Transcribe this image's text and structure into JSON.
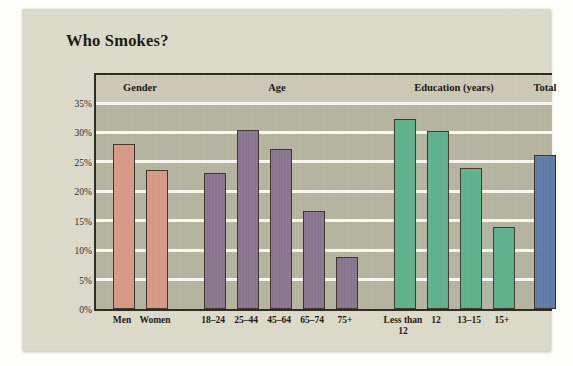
{
  "title": "Who Smokes?",
  "chart_data": {
    "type": "bar",
    "title": "Who Smokes?",
    "xlabel": "",
    "ylabel": "",
    "ylim": [
      0,
      35
    ],
    "ytick_labels": [
      "0%",
      "5%",
      "10%",
      "15%",
      "20%",
      "25%",
      "30%",
      "35%"
    ],
    "ytick_values": [
      0,
      5,
      10,
      15,
      20,
      25,
      30,
      35
    ],
    "grid": true,
    "legend": "none",
    "groups": [
      {
        "name": "Gender",
        "color": "#d79a84",
        "categories": [
          "Men",
          "Women"
        ],
        "values": [
          28.0,
          23.7
        ]
      },
      {
        "name": "Age",
        "color": "#8a7590",
        "categories": [
          "18–24",
          "25–44",
          "45–64",
          "65–74",
          "75+"
        ],
        "values": [
          23.1,
          30.5,
          27.2,
          16.7,
          8.8
        ]
      },
      {
        "name": "Education (years)",
        "color": "#5cb48c",
        "categories": [
          "Less than\n12",
          "12",
          "13–15",
          "15+"
        ],
        "values": [
          32.2,
          30.3,
          23.9,
          14.0
        ]
      },
      {
        "name": "Total",
        "color": "#5f7caa",
        "categories": [
          ""
        ],
        "values": [
          26.2
        ]
      }
    ],
    "categories": [
      "Men",
      "Women",
      "18–24",
      "25–44",
      "45–64",
      "65–74",
      "75+",
      "Less than 12",
      "12",
      "13–15",
      "15+",
      "Total"
    ],
    "values": [
      28.0,
      23.7,
      23.1,
      30.5,
      27.2,
      16.7,
      8.8,
      32.2,
      30.3,
      23.9,
      14.0,
      26.2
    ]
  },
  "colors": {
    "gender": "#d79a84",
    "age": "#8a7590",
    "education": "#5cb48c",
    "total": "#5f7caa",
    "plot_background": "#b6b5a0",
    "header_band": "#cdcab5",
    "card": "#dedccb",
    "gridline": "#fbfbf3",
    "axis": "#2a2720"
  }
}
